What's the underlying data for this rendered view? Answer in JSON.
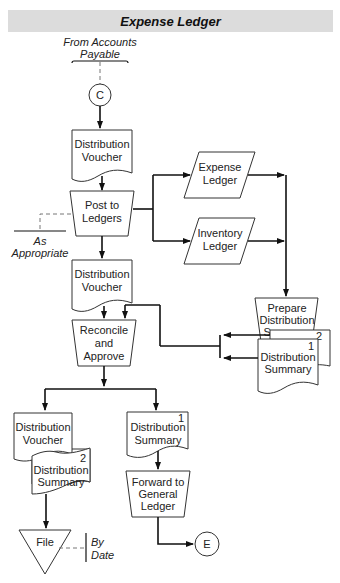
{
  "header": {
    "title": "Expense Ledger",
    "background": "#dcdcdc"
  },
  "annotations": {
    "from_line1": "From Accounts",
    "from_line2": "Payable",
    "as_line1": "As",
    "as_line2": "Appropriate",
    "by_line1": "By",
    "by_line2": "Date"
  },
  "connectors": {
    "start": "C",
    "end": "E"
  },
  "nodes": {
    "voucher1": {
      "line1": "Distribution",
      "line2": "Voucher",
      "type": "document"
    },
    "post": {
      "line1": "Post to",
      "line2": "Ledgers",
      "type": "manual-operation"
    },
    "expense_ledger": {
      "line1": "Expense",
      "line2": "Ledger",
      "type": "input-output"
    },
    "inventory_ledger": {
      "line1": "Inventory",
      "line2": "Ledger",
      "type": "input-output"
    },
    "voucher2": {
      "line1": "Distribution",
      "line2": "Voucher",
      "type": "document"
    },
    "prepare": {
      "line1": "Prepare",
      "line2": "Distribution",
      "line3": "Summary",
      "type": "manual-operation"
    },
    "summary_pair": {
      "line1": "Distribution",
      "line2": "Summary",
      "front_num": "1",
      "back_num": "2",
      "type": "multi-document"
    },
    "reconcile": {
      "line1": "Reconcile",
      "line2": "and",
      "line3": "Approve",
      "type": "manual-operation"
    },
    "voucher3": {
      "line1": "Distribution",
      "line2": "Voucher",
      "type": "document"
    },
    "summary2": {
      "line1": "Distribution",
      "line2": "Summary",
      "num": "2",
      "type": "document"
    },
    "summary1": {
      "line1": "Distribution",
      "line2": "Summary",
      "num": "1",
      "type": "document"
    },
    "forward": {
      "line1": "Forward to",
      "line2": "General",
      "line3": "Ledger",
      "type": "manual-operation"
    },
    "file": {
      "label": "File",
      "type": "offline-storage"
    }
  }
}
